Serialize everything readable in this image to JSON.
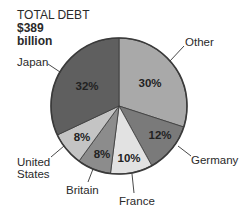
{
  "title": {
    "line1": "TOTAL DEBT",
    "line2": "$389",
    "line3": "billion"
  },
  "chart_data": {
    "type": "pie",
    "title": "TOTAL DEBT $389 billion",
    "categories": [
      "Other",
      "Germany",
      "France",
      "Britain",
      "United States",
      "Japan"
    ],
    "values": [
      30,
      12,
      10,
      8,
      8,
      32
    ],
    "value_labels": [
      "30%",
      "12%",
      "10%",
      "8%",
      "8%",
      "32%"
    ],
    "colors": [
      "#a9a9a9",
      "#7a7a7a",
      "#e2e2e2",
      "#8c8c8c",
      "#c4c4c4",
      "#5f5f5f"
    ],
    "start_angle": "12 o'clock",
    "direction": "clockwise",
    "legend": "none (direct callout labels)"
  },
  "labels": {
    "other": "Other",
    "germany": "Germany",
    "france": "France",
    "britain": "Britain",
    "us_line1": "United",
    "us_line2": "States",
    "japan": "Japan"
  },
  "pct": {
    "other": "30%",
    "germany": "12%",
    "france": "10%",
    "britain": "8%",
    "us": "8%",
    "japan": "32%"
  }
}
